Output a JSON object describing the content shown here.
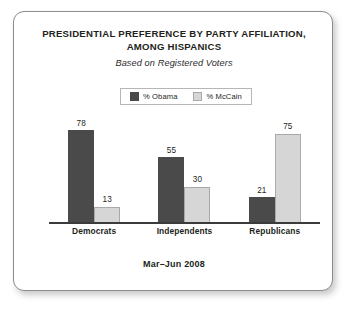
{
  "card": {
    "border_color": "#8c8c8c",
    "background": "#ffffff"
  },
  "header": {
    "title_line1": "PRESIDENTIAL PREFERENCE BY PARTY AFFILIATION,",
    "title_line2": "AMONG HISPANICS",
    "subtitle": "Based on Registered Voters"
  },
  "legend": {
    "items": [
      {
        "label": "% Obama",
        "color": "#4a4a4a",
        "swatch": "legend-swatch-obama"
      },
      {
        "label": "% McCain",
        "color": "#d6d6d6",
        "swatch": "legend-swatch-mccain"
      }
    ]
  },
  "footer": {
    "period": "Mar–Jun 2008"
  },
  "chart_data": {
    "type": "bar",
    "title": "PRESIDENTIAL PREFERENCE BY PARTY AFFILIATION, AMONG HISPANICS",
    "subtitle": "Based on Registered Voters",
    "note": "Mar–Jun 2008",
    "categories": [
      "Democrats",
      "Independents",
      "Republicans"
    ],
    "series": [
      {
        "name": "% Obama",
        "color": "#4a4a4a",
        "values": [
          78,
          55,
          21
        ]
      },
      {
        "name": "% McCain",
        "color": "#d6d6d6",
        "values": [
          13,
          30,
          75
        ]
      }
    ],
    "xlabel": "",
    "ylabel": "",
    "ylim": [
      0,
      85
    ],
    "grid": false,
    "value_labels": true,
    "legend_position": "top-center",
    "axis_color": "#3b3b3b"
  }
}
